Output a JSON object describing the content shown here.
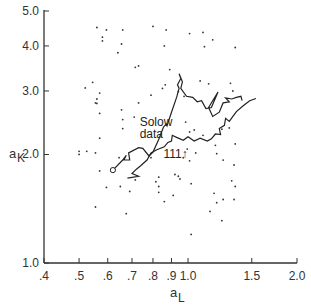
{
  "chart_data": {
    "type": "scatter",
    "title": "",
    "xlabel": "a_L",
    "ylabel": "a_K",
    "xlabel_parts": {
      "base": "a",
      "sub": "L"
    },
    "ylabel_parts": {
      "base": "a",
      "sub": "K"
    },
    "xscale": "log",
    "yscale": "log",
    "xlim": [
      0.4,
      2.0
    ],
    "ylim": [
      1.0,
      5.0
    ],
    "grid": false,
    "legend": null,
    "x_ticks": [
      {
        "value": 0.4,
        "label": ".4"
      },
      {
        "value": 0.5,
        "label": ".5"
      },
      {
        "value": 0.6,
        "label": ".6"
      },
      {
        "value": 0.7,
        "label": ".7"
      },
      {
        "value": 0.8,
        "label": ".8"
      },
      {
        "value": 0.9,
        "label": ".9"
      },
      {
        "value": 1.0,
        "label": "1.0"
      },
      {
        "value": 1.5,
        "label": "1.5"
      },
      {
        "value": 2.0,
        "label": "2.0"
      }
    ],
    "y_ticks": [
      {
        "value": 1.0,
        "label": "1.0"
      },
      {
        "value": 2.0,
        "label": "2.0"
      },
      {
        "value": 3.0,
        "label": "3.0"
      },
      {
        "value": 4.0,
        "label": "4.0"
      },
      {
        "value": 5.0,
        "label": "5.0"
      }
    ],
    "annotations": [
      {
        "text": "Solow",
        "x": 0.735,
        "y": 2.4
      },
      {
        "text": "data",
        "x": 0.735,
        "y": 2.22
      },
      {
        "text": "111↑",
        "x": 0.855,
        "y": 1.955
      }
    ],
    "series": [
      {
        "name": "scatter points",
        "kind": "points",
        "points": [
          [
            0.56,
            4.5
          ],
          [
            0.595,
            4.43
          ],
          [
            0.58,
            4.23
          ],
          [
            0.58,
            4.13
          ],
          [
            0.66,
            4.43
          ],
          [
            0.655,
            4.05
          ],
          [
            0.64,
            3.83
          ],
          [
            0.715,
            3.49
          ],
          [
            0.545,
            3.17
          ],
          [
            0.52,
            3.06
          ],
          [
            0.57,
            2.96
          ],
          [
            0.56,
            2.77
          ],
          [
            0.56,
            2.85
          ],
          [
            0.555,
            2.78
          ],
          [
            0.57,
            2.6
          ],
          [
            0.655,
            2.66
          ],
          [
            0.66,
            2.5
          ],
          [
            0.66,
            2.36
          ],
          [
            0.71,
            2.54
          ],
          [
            0.57,
            2.22
          ],
          [
            0.5,
            2.04
          ],
          [
            0.5,
            2.0
          ],
          [
            0.525,
            2.04
          ],
          [
            0.555,
            2.02
          ],
          [
            0.645,
            1.96
          ],
          [
            0.57,
            1.8
          ],
          [
            0.715,
            1.7
          ],
          [
            0.595,
            1.62
          ],
          [
            0.65,
            1.63
          ],
          [
            0.69,
            1.58
          ],
          [
            0.555,
            1.43
          ],
          [
            0.675,
            1.37
          ],
          [
            0.8,
            4.53
          ],
          [
            0.87,
            4.43
          ],
          [
            1.01,
            4.33
          ],
          [
            0.86,
            4.0
          ],
          [
            0.73,
            3.52
          ],
          [
            0.89,
            3.44
          ],
          [
            0.865,
            3.12
          ],
          [
            0.85,
            3.05
          ],
          [
            0.94,
            2.99
          ],
          [
            0.79,
            2.92
          ],
          [
            0.975,
            2.9
          ],
          [
            0.73,
            2.78
          ],
          [
            1.1,
            4.36
          ],
          [
            1.17,
            4.16
          ],
          [
            1.11,
            3.98
          ],
          [
            1.35,
            3.96
          ],
          [
            1.08,
            3.2
          ],
          [
            1.14,
            3.14
          ],
          [
            1.31,
            3.15
          ],
          [
            1.33,
            3.0
          ],
          [
            0.985,
            2.46
          ],
          [
            1.01,
            2.31
          ],
          [
            1.04,
            2.34
          ],
          [
            1.1,
            2.26
          ],
          [
            1.24,
            2.35
          ],
          [
            1.3,
            2.37
          ],
          [
            1.35,
            2.14
          ],
          [
            1.19,
            2.12
          ],
          [
            0.995,
            2.07
          ],
          [
            1.05,
            2.02
          ],
          [
            1.2,
            2.01
          ],
          [
            1.25,
            1.93
          ],
          [
            1.34,
            1.87
          ],
          [
            0.94,
            1.74
          ],
          [
            0.815,
            1.68
          ],
          [
            1.02,
            1.66
          ],
          [
            0.83,
            1.63
          ],
          [
            1.18,
            1.56
          ],
          [
            1.32,
            1.69
          ],
          [
            1.35,
            1.63
          ],
          [
            1.25,
            1.5
          ],
          [
            1.34,
            1.5
          ],
          [
            1.2,
            1.47
          ],
          [
            1.15,
            1.39
          ],
          [
            1.24,
            1.31
          ],
          [
            0.79,
            1.96
          ],
          [
            0.97,
            1.96
          ],
          [
            1.01,
            1.92
          ],
          [
            0.92,
            1.76
          ],
          [
            0.83,
            1.73
          ],
          [
            0.95,
            1.71
          ],
          [
            0.83,
            1.57
          ],
          [
            0.91,
            1.54
          ],
          [
            0.86,
            1.48
          ],
          [
            1.02,
            1.2
          ]
        ]
      },
      {
        "name": "Solow data",
        "kind": "line",
        "start_marker": "open-circle",
        "points": [
          [
            0.62,
            1.81
          ],
          [
            0.66,
            1.93
          ],
          [
            0.675,
            1.99
          ],
          [
            0.665,
            1.93
          ],
          [
            0.69,
            1.93
          ],
          [
            0.685,
            2.02
          ],
          [
            0.73,
            2.09
          ],
          [
            0.75,
            2.08
          ],
          [
            0.78,
            1.98
          ],
          [
            0.8,
            2.03
          ],
          [
            0.83,
            2.2
          ],
          [
            0.855,
            2.38
          ],
          [
            0.87,
            2.43
          ],
          [
            0.875,
            2.4
          ],
          [
            0.9,
            2.62
          ],
          [
            0.93,
            2.88
          ],
          [
            0.945,
            3.05
          ],
          [
            0.935,
            3.12
          ],
          [
            0.955,
            3.25
          ],
          [
            0.945,
            3.35
          ],
          [
            0.965,
            3.18
          ],
          [
            0.955,
            3.05
          ],
          [
            0.99,
            2.9
          ],
          [
            1.03,
            2.88
          ],
          [
            1.06,
            2.8
          ],
          [
            1.09,
            2.82
          ],
          [
            1.12,
            2.68
          ],
          [
            1.16,
            2.7
          ],
          [
            1.21,
            2.98
          ],
          [
            1.14,
            2.7
          ],
          [
            1.17,
            2.55
          ],
          [
            1.22,
            2.62
          ],
          [
            1.25,
            2.78
          ],
          [
            1.3,
            2.8
          ],
          [
            1.27,
            2.87
          ],
          [
            1.32,
            2.85
          ],
          [
            1.36,
            2.88
          ],
          [
            1.4,
            2.9
          ],
          [
            1.41,
            2.82
          ]
        ]
      },
      {
        "name": "111",
        "kind": "line",
        "points": [
          [
            0.68,
            1.72
          ],
          [
            0.73,
            1.74
          ],
          [
            0.7,
            1.77
          ],
          [
            0.72,
            1.82
          ],
          [
            0.74,
            1.86
          ],
          [
            0.77,
            1.93
          ],
          [
            0.79,
            2.02
          ],
          [
            0.82,
            2.06
          ],
          [
            0.86,
            2.1
          ],
          [
            0.88,
            2.16
          ],
          [
            0.9,
            2.18
          ],
          [
            0.905,
            2.26
          ],
          [
            0.93,
            2.23
          ],
          [
            0.97,
            2.19
          ],
          [
            1.0,
            2.24
          ],
          [
            1.04,
            2.18
          ],
          [
            1.08,
            2.22
          ],
          [
            1.13,
            2.18
          ],
          [
            1.16,
            2.21
          ],
          [
            1.19,
            2.28
          ],
          [
            1.23,
            2.27
          ],
          [
            1.22,
            2.36
          ],
          [
            1.26,
            2.41
          ],
          [
            1.27,
            2.52
          ],
          [
            1.3,
            2.47
          ],
          [
            1.33,
            2.55
          ],
          [
            1.36,
            2.63
          ],
          [
            1.42,
            2.73
          ],
          [
            1.48,
            2.82
          ],
          [
            1.54,
            2.86
          ]
        ]
      }
    ]
  }
}
